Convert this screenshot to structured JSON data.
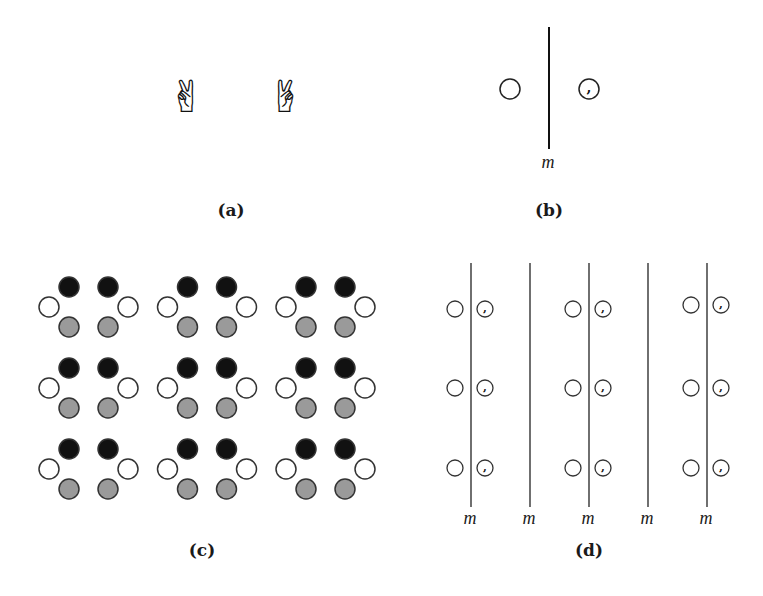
{
  "figure": {
    "panels": {
      "a": {
        "caption": "(a)",
        "objects": [
          {
            "name": "victory-hand-left",
            "glyph": "✌",
            "mirrored": false
          },
          {
            "name": "victory-hand-right",
            "glyph": "✌",
            "mirrored": true
          }
        ]
      },
      "b": {
        "caption": "(b)",
        "mirror_label": "m",
        "left_object": "plain-circle",
        "right_object": "comma-circle",
        "comma_glyph": ","
      },
      "c": {
        "caption": "(c)",
        "rows": 3,
        "columns": 3,
        "motif": [
          "black-circle",
          "black-circle",
          "open-circle",
          "open-circle",
          "gray-circle",
          "gray-circle"
        ],
        "colors": {
          "black": "#111111",
          "gray": "#9a9a9a",
          "open": "#ffffff",
          "stroke": "#333333"
        }
      },
      "d": {
        "caption": "(d)",
        "rows": 3,
        "motif_columns": 3,
        "mirror_lines": 5,
        "mirror_labels": [
          "m",
          "m",
          "m",
          "m",
          "m"
        ],
        "comma_glyph": ","
      }
    }
  }
}
